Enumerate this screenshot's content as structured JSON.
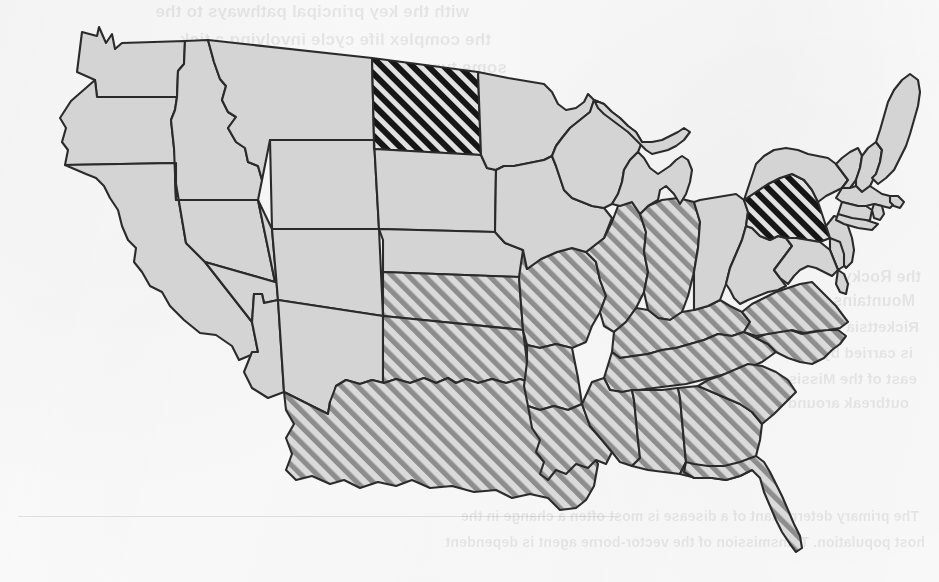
{
  "figure": {
    "kind": "choropleth-map",
    "region": "United States (contiguous 48 states)",
    "title": "",
    "caption": "",
    "background_color": "#fbfbfb"
  },
  "legend_colors": {
    "plain_state_fill": "#d4d4d4",
    "state_outline": "#2b2b2b",
    "light_hatch_stripe": "#8e8e8e",
    "light_hatch_background": "#d8d8d8",
    "dark_hatch_stripe": "#141414",
    "dark_hatch_background": "#dcdcdc",
    "water_fill": "#fbfbfb"
  },
  "categories": [
    {
      "id": "plain",
      "label": "unshaded",
      "fill": "#d4d4d4"
    },
    {
      "id": "light-hatch",
      "label": "light diagonal hatch",
      "fill": "#d8d8d8"
    },
    {
      "id": "dark-hatch",
      "label": "dark diagonal hatch",
      "fill": "#141414"
    }
  ],
  "states": {
    "dark_hatch": [
      "North Dakota",
      "Pennsylvania"
    ],
    "light_hatch": [
      "Kansas",
      "Oklahoma",
      "Texas",
      "Missouri",
      "Arkansas",
      "Louisiana",
      "Illinois",
      "Indiana",
      "Kentucky",
      "Tennessee",
      "Mississippi",
      "Alabama",
      "Georgia",
      "Florida",
      "South Carolina",
      "North Carolina",
      "Virginia"
    ],
    "plain": [
      "Washington",
      "Oregon",
      "California",
      "Nevada",
      "Idaho",
      "Montana",
      "Wyoming",
      "Utah",
      "Arizona",
      "Colorado",
      "New Mexico",
      "South Dakota",
      "Nebraska",
      "Minnesota",
      "Iowa",
      "Wisconsin",
      "Michigan",
      "Ohio",
      "West Virginia",
      "Maryland",
      "Delaware",
      "New Jersey",
      "New York",
      "Connecticut",
      "Rhode Island",
      "Massachusetts",
      "Vermont",
      "New Hampshire",
      "Maine"
    ]
  },
  "bleed_through_text": {
    "note": "faint mirrored text showing through from the reverse side of the scanned page",
    "lines": [
      {
        "text": "with the key principal pathways to the",
        "x": 470,
        "y": 2,
        "size": 17
      },
      {
        "text": "the complex life cycle involving a tick",
        "x": 448,
        "y": 30,
        "size": 17
      },
      {
        "text": "some type of intermediate",
        "x": 432,
        "y": 58,
        "size": 17
      },
      {
        "text": "because these mosquitoes",
        "x": 420,
        "y": 86,
        "size": 16
      },
      {
        "text": "which transmits the",
        "x": 418,
        "y": 114,
        "size": 16
      },
      {
        "text": "to the periodic",
        "x": 414,
        "y": 142,
        "size": 16
      },
      {
        "text": "and therefore",
        "x": 430,
        "y": 170,
        "size": 16
      },
      {
        "text": "and hot",
        "x": 470,
        "y": 198,
        "size": 16
      },
      {
        "text": "area of",
        "x": 468,
        "y": 226,
        "size": 16
      },
      {
        "text": "the Rocky",
        "x": 18,
        "y": 268,
        "size": 16
      },
      {
        "text": "Mountains and",
        "x": 24,
        "y": 292,
        "size": 16
      },
      {
        "text": "Rickettsia rickettsii",
        "x": 20,
        "y": 318,
        "size": 15
      },
      {
        "text": "is carried by the",
        "x": 26,
        "y": 344,
        "size": 15
      },
      {
        "text": "east of the Mississippi",
        "x": 22,
        "y": 370,
        "size": 15
      },
      {
        "text": "outbreak around Missouri",
        "x": 30,
        "y": 394,
        "size": 15
      },
      {
        "text": "The primary determinant of a disease is most often a change in the",
        "x": 20,
        "y": 508,
        "size": 14
      },
      {
        "text": "host population. Transmission of the vector-borne agent is dependent",
        "x": 14,
        "y": 534,
        "size": 14
      }
    ],
    "rule": {
      "x": 18,
      "y": 516,
      "width": 600
    }
  }
}
